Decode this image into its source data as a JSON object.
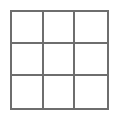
{
  "figure": {
    "kind": "grid-diagram",
    "title": "",
    "background_color": "#ffffff",
    "width": 118,
    "height": 120
  },
  "grid": {
    "rows": 3,
    "columns": 3,
    "line_color": "#6e6e6e",
    "line_width_px": 2,
    "cell_fill": "#ffffff",
    "bounds": {
      "left": 10,
      "top": 10,
      "width": 99,
      "height": 100
    },
    "vertical_divider_x": [
      41,
      75
    ],
    "horizontal_divider_y": [
      42,
      76
    ],
    "cells": [
      {
        "row": 1,
        "column": 1,
        "label": ""
      },
      {
        "row": 1,
        "column": 2,
        "label": ""
      },
      {
        "row": 1,
        "column": 3,
        "label": ""
      },
      {
        "row": 2,
        "column": 1,
        "label": ""
      },
      {
        "row": 2,
        "column": 2,
        "label": ""
      },
      {
        "row": 2,
        "column": 3,
        "label": ""
      },
      {
        "row": 3,
        "column": 1,
        "label": ""
      },
      {
        "row": 3,
        "column": 2,
        "label": ""
      },
      {
        "row": 3,
        "column": 3,
        "label": ""
      }
    ]
  }
}
